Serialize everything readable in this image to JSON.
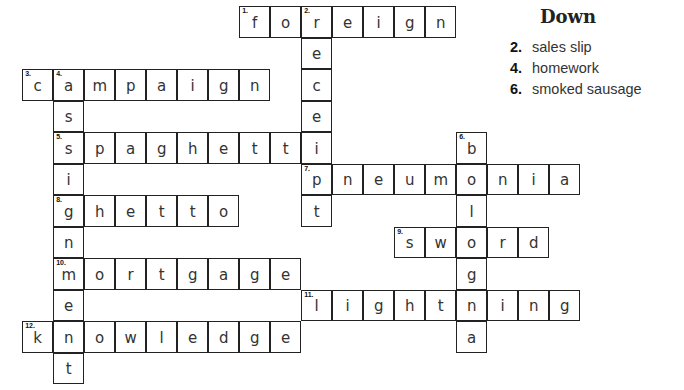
{
  "puzzle": {
    "grid_origin": {
      "x": 23,
      "y": 7
    },
    "cell_w": 31,
    "cell_h": 31.5,
    "words": [
      {
        "num": "1",
        "dir": "across",
        "answer": "foreign",
        "row": 0,
        "col": 7
      },
      {
        "num": "2",
        "dir": "down",
        "answer": "receipt",
        "row": 0,
        "col": 9
      },
      {
        "num": "3",
        "dir": "across",
        "answer": "campaign",
        "row": 2,
        "col": 0
      },
      {
        "num": "4",
        "dir": "down",
        "answer": "assignment",
        "row": 2,
        "col": 1
      },
      {
        "num": "5",
        "dir": "across",
        "answer": "spaghetti",
        "row": 4,
        "col": 1
      },
      {
        "num": "6",
        "dir": "down",
        "answer": "bologna",
        "row": 4,
        "col": 14
      },
      {
        "num": "7",
        "dir": "across",
        "answer": "pneumonia",
        "row": 5,
        "col": 9
      },
      {
        "num": "8",
        "dir": "across",
        "answer": "ghetto",
        "row": 6,
        "col": 1
      },
      {
        "num": "9",
        "dir": "across",
        "answer": "sword",
        "row": 7,
        "col": 12
      },
      {
        "num": "10",
        "dir": "across",
        "answer": "mortgage",
        "row": 8,
        "col": 1
      },
      {
        "num": "11",
        "dir": "across",
        "answer": "lightning",
        "row": 9,
        "col": 9
      },
      {
        "num": "12",
        "dir": "across",
        "answer": "knowledge",
        "row": 10,
        "col": 0
      }
    ]
  },
  "clues": {
    "heading": "Down",
    "items": [
      {
        "num": "2.",
        "text": "sales slip"
      },
      {
        "num": "4.",
        "text": "homework"
      },
      {
        "num": "6.",
        "text": "smoked sausage"
      }
    ]
  }
}
